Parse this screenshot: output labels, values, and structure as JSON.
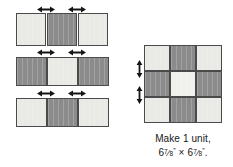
{
  "figure": {
    "colors": {
      "light_fabric": "#e9e9e5",
      "lighter_fabric": "#f0f0ec",
      "dark_fabric": "#8b8b8b",
      "patch_outline": "#4a4a4a",
      "background": "#ffffff",
      "text": "#171717"
    },
    "rows": [
      {
        "name": "row-1",
        "patches": [
          "light",
          "dark",
          "light"
        ],
        "seam_arrows": 2,
        "seam_arrow_direction": "horizontal-double"
      },
      {
        "name": "row-2",
        "patches": [
          "dark",
          "light",
          "dark"
        ],
        "seam_arrows": 2,
        "seam_arrow_direction": "horizontal-double"
      },
      {
        "name": "row-3",
        "patches": [
          "light",
          "dark",
          "light"
        ],
        "seam_arrows": 2,
        "seam_arrow_direction": "horizontal-double"
      }
    ],
    "assembled_unit": {
      "name": "nine-patch-unit",
      "grid": [
        [
          "light",
          "dark",
          "light"
        ],
        [
          "dark",
          "lighter",
          "dark"
        ],
        [
          "light",
          "dark",
          "light"
        ]
      ],
      "seam_arrows": 2,
      "seam_arrow_direction": "vertical-double"
    },
    "caption": {
      "line1": "Make 1 unit,",
      "dimension_whole": "6",
      "dimension_numerator": "7",
      "dimension_denominator": "8",
      "dimension_slash": "⁄",
      "inch_mark": "”",
      "times_symbol": "×",
      "period": ".",
      "full_text": "Make 1 unit, 6 7/8” × 6 7/8”."
    }
  }
}
